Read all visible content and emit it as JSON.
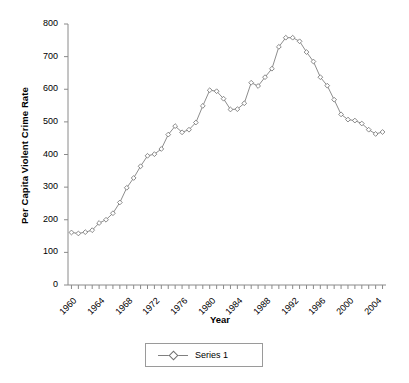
{
  "chart_data": {
    "type": "line",
    "title": "",
    "xlabel": "Year",
    "ylabel": "Per Capita Violent Crime Rate",
    "xlim": [
      1959.5,
      2005.5
    ],
    "ylim": [
      0,
      800
    ],
    "yticks": [
      0,
      100,
      200,
      300,
      400,
      500,
      600,
      700,
      800
    ],
    "xticks": [
      1960,
      1964,
      1968,
      1972,
      1976,
      1980,
      1984,
      1988,
      1992,
      1996,
      2000,
      2004
    ],
    "xtick_rotation": -45,
    "grid": false,
    "legend": {
      "position": "bottom",
      "entries": [
        {
          "name": "Series 1",
          "marker": "diamond-open",
          "line_color": "#808080"
        }
      ]
    },
    "series": [
      {
        "name": "Series 1",
        "marker": "diamond-open",
        "color": "#808080",
        "x": [
          1960,
          1961,
          1962,
          1963,
          1964,
          1965,
          1966,
          1967,
          1968,
          1969,
          1970,
          1971,
          1972,
          1973,
          1974,
          1975,
          1976,
          1977,
          1978,
          1979,
          1980,
          1981,
          1982,
          1983,
          1984,
          1985,
          1986,
          1987,
          1988,
          1989,
          1990,
          1991,
          1992,
          1993,
          1994,
          1995,
          1996,
          1997,
          1998,
          1999,
          2000,
          2001,
          2002,
          2003,
          2004,
          2005
        ],
        "values": [
          161,
          158,
          162,
          168,
          190,
          200,
          220,
          253,
          298,
          328,
          364,
          396,
          401,
          417,
          461,
          487,
          468,
          476,
          498,
          549,
          597,
          594,
          571,
          538,
          539,
          557,
          620,
          610,
          637,
          663,
          730,
          758,
          758,
          747,
          714,
          685,
          637,
          611,
          568,
          523,
          507,
          504,
          495,
          476,
          463,
          469
        ]
      }
    ]
  }
}
